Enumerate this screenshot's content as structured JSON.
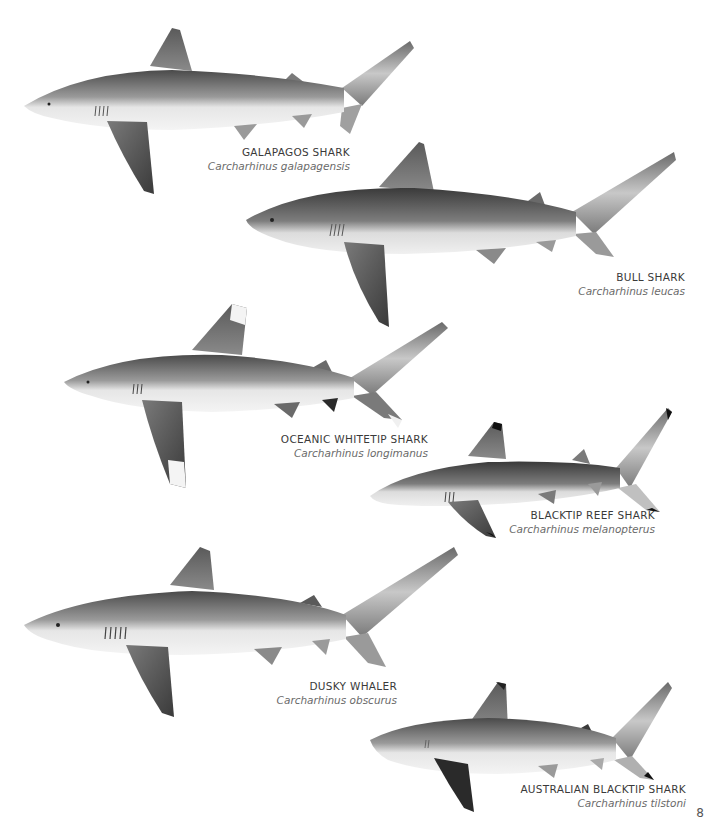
{
  "page": {
    "number": "8",
    "background": "#ffffff"
  },
  "sharks": [
    {
      "common_name": "GALAPAGOS SHARK",
      "scientific_name": "Carcharhinus galapagensis",
      "body_color": "#8a8a8a",
      "fin_tip": "none"
    },
    {
      "common_name": "BULL SHARK",
      "scientific_name": "Carcharhinus leucas",
      "body_color": "#6f6f6f",
      "fin_tip": "none"
    },
    {
      "common_name": "OCEANIC WHITETIP SHARK",
      "scientific_name": "Carcharhinus longimanus",
      "body_color": "#757575",
      "fin_tip": "white"
    },
    {
      "common_name": "BLACKTIP REEF SHARK",
      "scientific_name": "Carcharhinus melanopterus",
      "body_color": "#6e6e6e",
      "fin_tip": "black"
    },
    {
      "common_name": "DUSKY WHALER",
      "scientific_name": "Carcharhinus obscurus",
      "body_color": "#7a7a7a",
      "fin_tip": "none"
    },
    {
      "common_name": "AUSTRALIAN BLACKTIP SHARK",
      "scientific_name": "Carcharhinus tilstoni",
      "body_color": "#8c8c8c",
      "fin_tip": "black"
    }
  ]
}
